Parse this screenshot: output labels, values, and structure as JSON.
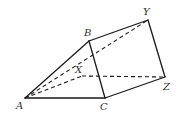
{
  "figure": {
    "type": "triangular prism",
    "labels": {
      "A": "A",
      "B": "B",
      "C": "C",
      "X": "X",
      "Y": "Y",
      "Z": "Z"
    },
    "vertices": {
      "A": [
        25,
        98
      ],
      "B": [
        89,
        41
      ],
      "C": [
        105,
        98
      ],
      "X": [
        82,
        76
      ],
      "Y": [
        148,
        20
      ],
      "Z": [
        165,
        77
      ]
    },
    "solid_edges": [
      [
        "A",
        "B"
      ],
      [
        "A",
        "C"
      ],
      [
        "B",
        "C"
      ],
      [
        "B",
        "Y"
      ],
      [
        "C",
        "Z"
      ],
      [
        "Y",
        "Z"
      ]
    ],
    "dashed_edges": [
      [
        "A",
        "X"
      ],
      [
        "A",
        "Y"
      ],
      [
        "X",
        "Z"
      ]
    ],
    "colors": {
      "line": "#1a1a1a",
      "label": "#333333",
      "background": "#ffffff"
    }
  }
}
